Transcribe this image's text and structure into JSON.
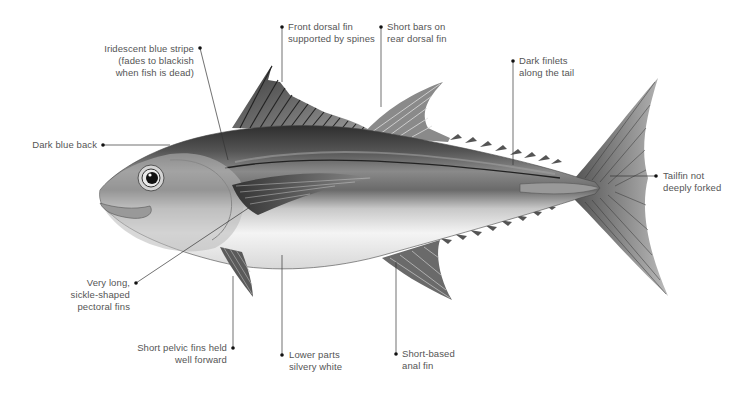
{
  "colors": {
    "background": "#ffffff",
    "label_text": "#555555",
    "leader_line": "#333333",
    "dot": "#111111",
    "back": "#3a3a3a",
    "belly": "#f2f2f2"
  },
  "labels": [
    {
      "id": "stripe",
      "lines": [
        "Iridescent blue stripe",
        "(fades to blackish",
        "when fish is dead)"
      ],
      "align": "right"
    },
    {
      "id": "back",
      "lines": [
        "Dark blue back"
      ],
      "align": "right"
    },
    {
      "id": "front-dorsal",
      "lines": [
        "Front dorsal fin",
        "supported by spines"
      ],
      "align": "left"
    },
    {
      "id": "rear-dorsal",
      "lines": [
        "Short bars on",
        "rear dorsal fin"
      ],
      "align": "left"
    },
    {
      "id": "finlets",
      "lines": [
        "Dark finlets",
        "along the tail"
      ],
      "align": "left"
    },
    {
      "id": "tailfin",
      "lines": [
        "Tailfin not",
        "deeply forked"
      ],
      "align": "left"
    },
    {
      "id": "pectoral",
      "lines": [
        "Very long,",
        "sickle-shaped",
        "pectoral fins"
      ],
      "align": "right"
    },
    {
      "id": "pelvic",
      "lines": [
        "Short pelvic fins held",
        "well forward"
      ],
      "align": "right"
    },
    {
      "id": "lower-parts",
      "lines": [
        "Lower parts",
        "silvery white"
      ],
      "align": "left"
    },
    {
      "id": "anal",
      "lines": [
        "Short-based",
        "anal fin"
      ],
      "align": "left"
    }
  ]
}
